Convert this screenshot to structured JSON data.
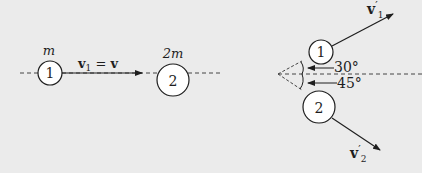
{
  "colors": {
    "background": "#ebebeb",
    "ink": "#1e1e1e",
    "circle_fill": "#ffffff"
  },
  "before": {
    "ball1": {
      "number": "1",
      "mass_label": "m"
    },
    "ball2": {
      "number": "2",
      "mass_label": "2m"
    },
    "velocity_label": {
      "vec": "v",
      "sub": "1",
      "eq": " = ",
      "rhs": "v"
    }
  },
  "after": {
    "ball1": {
      "number": "1"
    },
    "ball2": {
      "number": "2"
    },
    "v1_label": {
      "vec": "v",
      "prime": "′",
      "sub": "1"
    },
    "v2_label": {
      "vec": "v",
      "prime": "′",
      "sub": "2"
    },
    "angle1": "30°",
    "angle2": "45°"
  }
}
